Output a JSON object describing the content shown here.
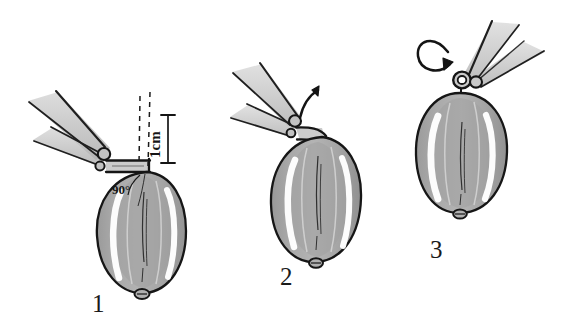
{
  "figure": {
    "background_color": "#ffffff",
    "ink_color": "#1a1a1a",
    "body_fill_color": "#a8a8a8",
    "body_shadow_color": "#8f8f8f",
    "highlight_color": "#ffffff",
    "instrument_fill_color": "#b5b5b5",
    "instrument_shade_color": "#cfcfcf"
  },
  "panels": [
    {
      "id": "panel-1",
      "number": "1",
      "description": "Hemostat clamped horizontally across the top of the oval organ, showing a 90 degree angle and a 1 cm measurement from the dashed vertical axis",
      "annotations": {
        "angle": "90°",
        "measurement": "1cm"
      }
    },
    {
      "id": "panel-2",
      "number": "2",
      "description": "Hemostat rotated upward along the organ axis, curved arrow indicating direction of lift",
      "annotations": {
        "arrow": "rotate-up-arrow"
      }
    },
    {
      "id": "panel-3",
      "number": "3",
      "description": "Hemostat viewed end-on at the top pole, circular arrow indicating axial rotation of the organ",
      "annotations": {
        "arrow": "rotate-axial-arrow"
      }
    }
  ]
}
